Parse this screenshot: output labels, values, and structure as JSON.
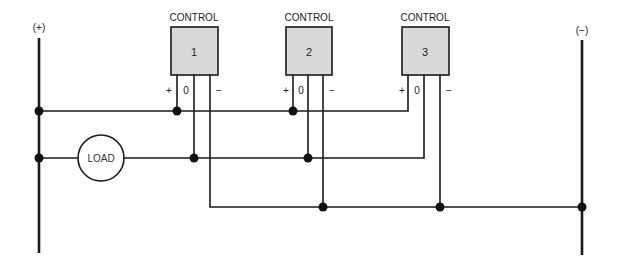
{
  "diagram": {
    "buses": {
      "positive": {
        "label": "(+)",
        "x": 39,
        "y_top": 38,
        "y_bottom": 253
      },
      "negative": {
        "label": "(−)",
        "x": 582,
        "y_top": 40,
        "y_bottom": 255
      }
    },
    "controls": [
      {
        "header": "CONTROL",
        "number": "1",
        "x": 171,
        "terminals": {
          "plus": "+",
          "zero": "0",
          "minus": "−"
        }
      },
      {
        "header": "CONTROL",
        "number": "2",
        "x": 286,
        "terminals": {
          "plus": "+",
          "zero": "0",
          "minus": "−"
        }
      },
      {
        "header": "CONTROL",
        "number": "3",
        "x": 402,
        "terminals": {
          "plus": "+",
          "zero": "0",
          "minus": "−"
        }
      }
    ],
    "load": {
      "label": "LOAD"
    },
    "colors": {
      "line": "#1a1a1a",
      "box_fill": "#d9d9d9",
      "background": "#ffffff"
    }
  }
}
